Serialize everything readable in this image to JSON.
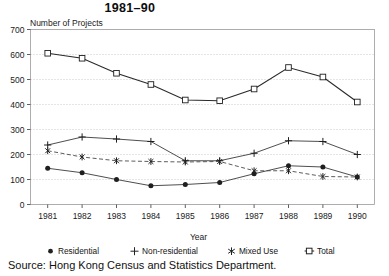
{
  "chart_data": {
    "type": "line",
    "title": "1981–90",
    "ylabel": "Number of Projects",
    "xlabel": "Year",
    "categories": [
      "1981",
      "1982",
      "1983",
      "1984",
      "1985",
      "1986",
      "1987",
      "1988",
      "1989",
      "1990"
    ],
    "ylim": [
      0,
      700
    ],
    "yticks": [
      0,
      100,
      200,
      300,
      400,
      500,
      600,
      700
    ],
    "ytick_labels": [
      "0",
      "100",
      "200",
      "300",
      "400",
      "500",
      "600",
      "700"
    ],
    "grid": true,
    "grid_style": "dotted-horizontal",
    "legend_position": "bottom",
    "series": [
      {
        "name": "Residential",
        "marker": "filled-circle",
        "line": "solid",
        "color": "#3a3a3a",
        "values": [
          145,
          127,
          100,
          75,
          80,
          88,
          123,
          155,
          150,
          110
        ]
      },
      {
        "name": "Non-residential",
        "marker": "plus",
        "line": "solid",
        "color": "#3a3a3a",
        "values": [
          238,
          270,
          262,
          252,
          175,
          175,
          205,
          255,
          252,
          200
        ]
      },
      {
        "name": "Mixed Use",
        "marker": "asterisk",
        "line": "dashed",
        "color": "#4a4a4a",
        "values": [
          215,
          190,
          175,
          172,
          170,
          172,
          135,
          135,
          112,
          110
        ]
      },
      {
        "name": "Total",
        "marker": "open-square",
        "line": "solid",
        "color": "#2a2a2a",
        "values": [
          605,
          585,
          525,
          480,
          418,
          415,
          462,
          548,
          510,
          410
        ]
      }
    ]
  },
  "legend": {
    "items": [
      {
        "label": "Residential",
        "marker": "filled-circle-icon"
      },
      {
        "label": "Non-residential",
        "marker": "plus-icon"
      },
      {
        "label": "Mixed Use",
        "marker": "asterisk-icon"
      },
      {
        "label": "Total",
        "marker": "open-square-icon"
      }
    ]
  },
  "source": {
    "text": "Source:  Hong Kong Census and Statistics Department."
  },
  "colors": {
    "plot_border": "#9a9a9a",
    "grid": "#bdbdbd",
    "axis": "#4d4d4d",
    "text": "#1a1a1a",
    "background": "#ffffff"
  }
}
